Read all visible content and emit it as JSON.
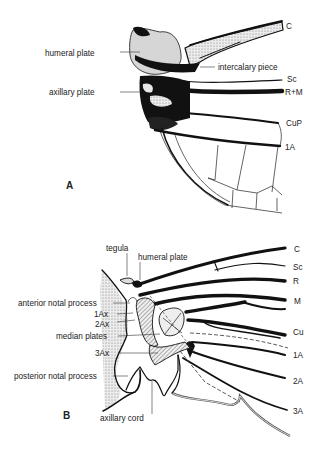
{
  "figure": {
    "panel_a": {
      "label": "A",
      "left_labels": {
        "humeral_plate": "humeral plate",
        "axillary_plate": "axillary plate"
      },
      "right_labels": {
        "c": "C",
        "intercalary_piece": "intercalary piece",
        "sc": "Sc",
        "rm": "R+M",
        "cup": "CuP",
        "a1": "1A"
      }
    },
    "panel_b": {
      "label": "B",
      "left_labels": {
        "tegula": "tegula",
        "humeral_plate": "humeral plate",
        "anterior_notal_process": "anterior notal process",
        "ax1": "1Ax",
        "ax2": "2Ax",
        "median_plates": "median plates",
        "ax3": "3Ax",
        "posterior_notal_process": "posterior notal process",
        "axillary_cord": "axillary cord"
      },
      "right_labels": {
        "c": "C",
        "sc": "Sc",
        "r": "R",
        "m": "M",
        "cu": "Cu",
        "a1": "1A",
        "a2": "2A",
        "a3": "3A"
      }
    }
  }
}
